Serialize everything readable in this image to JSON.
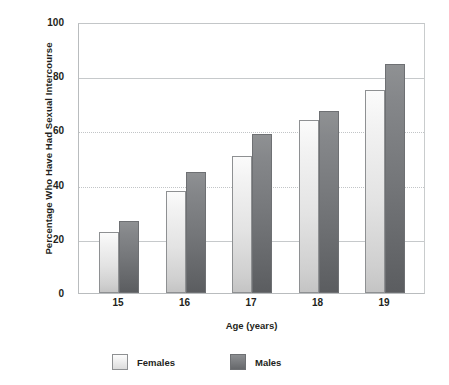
{
  "chart_data": {
    "type": "bar",
    "title": "",
    "xlabel": "Age (years)",
    "ylabel": "Percentage Who Have Had Sexual Intercourse",
    "categories": [
      "15",
      "16",
      "17",
      "18",
      "19"
    ],
    "series": [
      {
        "name": "Females",
        "values": [
          22.5,
          37.5,
          50.5,
          64,
          75
        ],
        "color": "#e8e8e8"
      },
      {
        "name": "Males",
        "values": [
          26.5,
          44.5,
          58.5,
          67,
          84.5
        ],
        "color": "#76787b"
      }
    ],
    "ylim": [
      0,
      100
    ],
    "yticks": [
      "0",
      "20",
      "40",
      "60",
      "80",
      "100"
    ],
    "ytick_values": [
      0,
      20,
      40,
      60,
      80,
      100
    ],
    "grid": true,
    "legend_position": "bottom-left"
  },
  "legend": {
    "items": [
      {
        "label": "Females",
        "swatch": "female"
      },
      {
        "label": "Males",
        "swatch": "male"
      }
    ]
  }
}
